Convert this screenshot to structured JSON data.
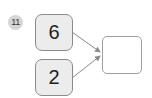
{
  "problem": {
    "number": "11",
    "inputs": [
      {
        "value": "6"
      },
      {
        "value": "2"
      }
    ],
    "answer": {
      "value": ""
    }
  },
  "colors": {
    "box_fill": "#ececec",
    "box_border": "#8a8a8a",
    "badge_fill": "#d6d6d6",
    "arrow": "#8a8a8a"
  }
}
